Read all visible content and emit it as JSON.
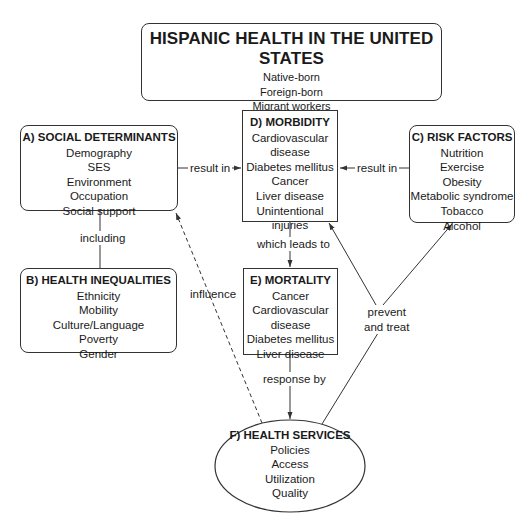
{
  "main": {
    "title": "HISPANIC HEALTH IN THE UNITED STATES",
    "items": [
      "Native-born",
      "Foreign-born",
      "Migrant workers",
      "Undocumented"
    ]
  },
  "social_determinants": {
    "title": "A) SOCIAL DETERMINANTS",
    "items": [
      "Demography",
      "SES",
      "Environment",
      "Occupation",
      "Social support"
    ]
  },
  "health_inequalities": {
    "title": "B) HEALTH INEQUALITIES",
    "items": [
      "Ethnicity",
      "Mobility",
      "Culture/Language",
      "Poverty",
      "Gender"
    ]
  },
  "risk_factors": {
    "title": "C) RISK FACTORS",
    "items": [
      "Nutrition",
      "Exercise",
      "Obesity",
      "Metabolic syndrome",
      "Tobacco",
      "Alcohol"
    ]
  },
  "morbidity": {
    "title": "D) MORBIDITY",
    "items": [
      "Cardiovascular",
      "disease",
      "Diabetes mellitus",
      "Cancer",
      "Liver disease",
      "Unintentional",
      "injuries"
    ]
  },
  "mortality": {
    "title": "E) MORTALITY",
    "items": [
      "Cancer",
      "Cardiovascular",
      "disease",
      "Diabetes mellitus",
      "Liver disease"
    ]
  },
  "health_services": {
    "title": "F) HEALTH SERVICES",
    "items": [
      "Policies",
      "Access",
      "Utilization",
      "Quality"
    ]
  },
  "edges": {
    "a_to_d": "result in",
    "c_to_d": "result in",
    "a_to_b": "including",
    "d_to_e": "which leads to",
    "e_to_f": "response by",
    "f_to_a": "influence",
    "f_to_cd_line1": "prevent",
    "f_to_cd_line2": "and treat"
  },
  "colors": {
    "stroke": "#333333",
    "text": "#1a1a1a",
    "background": "#ffffff"
  }
}
